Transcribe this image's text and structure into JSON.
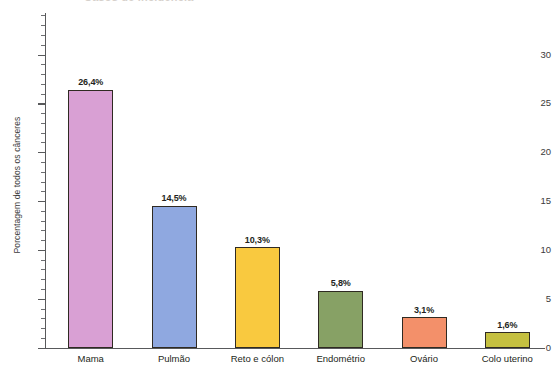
{
  "chart_data": {
    "type": "bar",
    "title": "Casos de incidência",
    "title_cropped": true,
    "xlabel": "",
    "ylabel": "Porcentagem de todos os cânceres",
    "categories": [
      "Mama",
      "Pulmão",
      "Reto e cólon",
      "Endométrio",
      "Ovário",
      "Colo uterino"
    ],
    "values": [
      26.4,
      14.5,
      10.3,
      5.8,
      3.1,
      1.6
    ],
    "value_labels": [
      "26,4%",
      "14,5%",
      "10,3%",
      "5,8%",
      "3,1%",
      "1,6%"
    ],
    "bar_colors": [
      "#d9a0d4",
      "#8fa8e0",
      "#f9c93f",
      "#87a165",
      "#f3906a",
      "#c5c040"
    ],
    "bar_outline_color": "#2f2a22",
    "ylim": [
      0,
      34.5
    ],
    "ytick_labels": [
      "0",
      "5",
      "10",
      "15",
      "20",
      "25",
      "30"
    ],
    "ytick_values": [
      0,
      5,
      10,
      15,
      20,
      25,
      30
    ],
    "minor_tick_interval": 1,
    "grid": false,
    "legend": null,
    "axis_color": "#58595b",
    "background": "#ffffff"
  }
}
